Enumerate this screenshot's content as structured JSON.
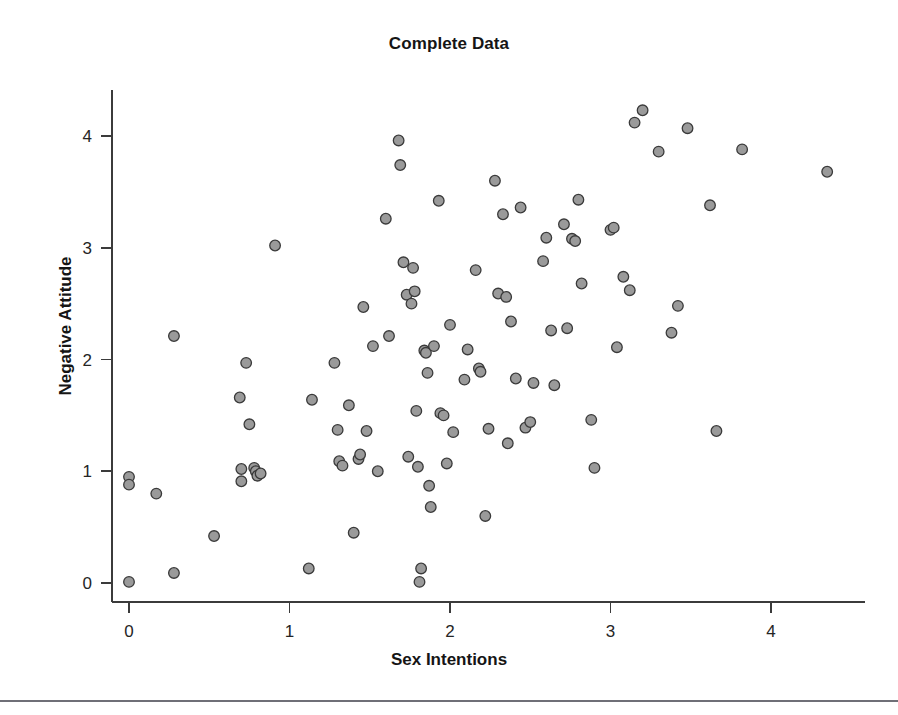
{
  "figure": {
    "title": "Complete Data",
    "xlabel": "Sex Intentions",
    "ylabel": "Negative Attitude"
  },
  "axes": {
    "x_ticks": [
      "0",
      "1",
      "2",
      "3",
      "4"
    ],
    "y_ticks": [
      "0",
      "1",
      "2",
      "3",
      "4"
    ]
  },
  "style": {
    "marker_fill": "#9a9a9a",
    "marker_stroke": "#3a3a3a",
    "axis_color": "#3b3b3b",
    "background": "#ffffff",
    "footer_rule_color": "#6f6f77"
  },
  "chart_data": {
    "type": "scatter",
    "title": "Complete Data",
    "xlabel": "Sex Intentions",
    "ylabel": "Negative Attitude",
    "xlim": [
      -0.12,
      4.58
    ],
    "ylim": [
      -0.17,
      4.42
    ],
    "xticks": [
      0,
      1,
      2,
      3,
      4
    ],
    "yticks": [
      0,
      1,
      2,
      3,
      4
    ],
    "grid": false,
    "legend": null,
    "n_points": 121,
    "series": [
      {
        "name": "observations",
        "marker": "circle",
        "points": [
          [
            0.0,
            0.95
          ],
          [
            0.0,
            0.88
          ],
          [
            0.0,
            0.01
          ],
          [
            0.17,
            0.8
          ],
          [
            0.28,
            2.21
          ],
          [
            0.28,
            0.09
          ],
          [
            0.53,
            0.42
          ],
          [
            0.69,
            1.66
          ],
          [
            0.7,
            1.02
          ],
          [
            0.7,
            0.91
          ],
          [
            0.73,
            1.97
          ],
          [
            0.75,
            1.42
          ],
          [
            0.78,
            1.03
          ],
          [
            0.79,
            1.0
          ],
          [
            0.8,
            0.96
          ],
          [
            0.82,
            0.98
          ],
          [
            0.91,
            3.02
          ],
          [
            1.12,
            0.13
          ],
          [
            1.14,
            1.64
          ],
          [
            1.28,
            1.97
          ],
          [
            1.3,
            1.37
          ],
          [
            1.31,
            1.09
          ],
          [
            1.33,
            1.05
          ],
          [
            1.37,
            1.59
          ],
          [
            1.4,
            0.45
          ],
          [
            1.43,
            1.11
          ],
          [
            1.44,
            1.15
          ],
          [
            1.46,
            2.47
          ],
          [
            1.48,
            1.36
          ],
          [
            1.52,
            2.12
          ],
          [
            1.55,
            1.0
          ],
          [
            1.6,
            3.26
          ],
          [
            1.62,
            2.21
          ],
          [
            1.68,
            3.96
          ],
          [
            1.69,
            3.74
          ],
          [
            1.71,
            2.87
          ],
          [
            1.73,
            2.58
          ],
          [
            1.74,
            1.13
          ],
          [
            1.76,
            2.5
          ],
          [
            1.77,
            2.82
          ],
          [
            1.78,
            2.61
          ],
          [
            1.79,
            1.54
          ],
          [
            1.8,
            1.04
          ],
          [
            1.81,
            0.01
          ],
          [
            1.82,
            0.13
          ],
          [
            1.84,
            2.08
          ],
          [
            1.85,
            2.06
          ],
          [
            1.86,
            1.88
          ],
          [
            1.87,
            0.87
          ],
          [
            1.88,
            0.68
          ],
          [
            1.9,
            2.12
          ],
          [
            1.93,
            3.42
          ],
          [
            1.94,
            1.52
          ],
          [
            1.96,
            1.5
          ],
          [
            1.98,
            1.07
          ],
          [
            2.0,
            2.31
          ],
          [
            2.02,
            1.35
          ],
          [
            2.09,
            1.82
          ],
          [
            2.11,
            2.09
          ],
          [
            2.16,
            2.8
          ],
          [
            2.18,
            1.92
          ],
          [
            2.19,
            1.89
          ],
          [
            2.22,
            0.6
          ],
          [
            2.24,
            1.38
          ],
          [
            2.28,
            3.6
          ],
          [
            2.3,
            2.59
          ],
          [
            2.33,
            3.3
          ],
          [
            2.35,
            2.56
          ],
          [
            2.36,
            1.25
          ],
          [
            2.38,
            2.34
          ],
          [
            2.41,
            1.83
          ],
          [
            2.44,
            3.36
          ],
          [
            2.47,
            1.39
          ],
          [
            2.5,
            1.44
          ],
          [
            2.52,
            1.79
          ],
          [
            2.58,
            2.88
          ],
          [
            2.6,
            3.09
          ],
          [
            2.63,
            2.26
          ],
          [
            2.65,
            1.77
          ],
          [
            2.71,
            3.21
          ],
          [
            2.73,
            2.28
          ],
          [
            2.76,
            3.08
          ],
          [
            2.78,
            3.06
          ],
          [
            2.8,
            3.43
          ],
          [
            2.82,
            2.68
          ],
          [
            2.88,
            1.46
          ],
          [
            2.9,
            1.03
          ],
          [
            3.0,
            3.16
          ],
          [
            3.02,
            3.18
          ],
          [
            3.04,
            2.11
          ],
          [
            3.08,
            2.74
          ],
          [
            3.12,
            2.62
          ],
          [
            3.15,
            4.12
          ],
          [
            3.2,
            4.23
          ],
          [
            3.3,
            3.86
          ],
          [
            3.38,
            2.24
          ],
          [
            3.42,
            2.48
          ],
          [
            3.48,
            4.07
          ],
          [
            3.62,
            3.38
          ],
          [
            3.66,
            1.36
          ],
          [
            3.82,
            3.88
          ],
          [
            4.35,
            3.68
          ]
        ]
      }
    ]
  }
}
